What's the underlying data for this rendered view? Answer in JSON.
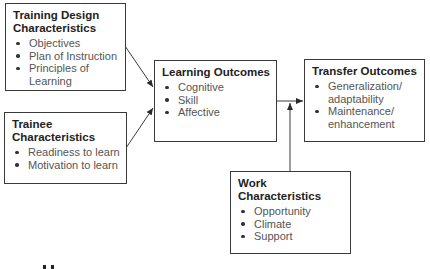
{
  "boxes": {
    "training_design": {
      "title": "Training Design Characteristics",
      "items": [
        "Objectives",
        "Plan of Instruction",
        "Principles of Learning"
      ]
    },
    "trainee": {
      "title": "Trainee Characteristics",
      "items": [
        "Readiness to learn",
        "Motivation to learn"
      ]
    },
    "learning_outcomes": {
      "title": "Learning Outcomes",
      "items": [
        "Cognitive",
        "Skill",
        "Affective"
      ]
    },
    "transfer_outcomes": {
      "title": "Transfer Outcomes",
      "items": [
        "Generalization/ adaptability",
        "Maintenance/ enhancement"
      ]
    },
    "work": {
      "title": "Work Characteristics",
      "items": [
        "Opportunity",
        "Climate",
        "Support"
      ]
    }
  },
  "colors": {
    "line": "#3a3a3a",
    "text": "#555555",
    "title": "#222222"
  }
}
